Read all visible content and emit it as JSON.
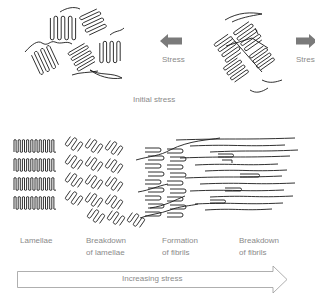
{
  "top_section": {
    "left_stress_label": "Stress",
    "right_stress_label": "Stress",
    "caption": "Initial stress",
    "arrow_color": "#7a7a7a"
  },
  "stages": [
    {
      "line1": "Lamellae",
      "line2": ""
    },
    {
      "line1": "Breakdown",
      "line2": "of lamellae"
    },
    {
      "line1": "Formation",
      "line2": "of fibrils"
    },
    {
      "line1": "Breakdown",
      "line2": "of fibrils"
    }
  ],
  "progress_arrow": {
    "label": "Increasing stress",
    "stroke_color": "#9a9a9a"
  },
  "colors": {
    "ink": "#1a1a1a",
    "label_text": "#8a8a8a"
  }
}
